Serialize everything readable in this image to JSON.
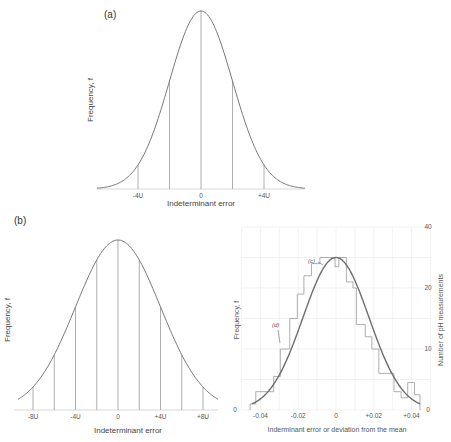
{
  "chart_data": [
    {
      "id": "a",
      "type": "line",
      "panel_label": "(a)",
      "title": "",
      "xlabel": "Indeterminant error",
      "ylabel": "Frequency, f",
      "x_tick_labels": [
        "-4U",
        "0",
        "+4U"
      ],
      "x_tick_positions_sigma": [
        -2,
        0,
        2
      ],
      "vertical_lines_sigma": [
        -2,
        -1,
        0,
        1,
        2
      ],
      "curve": "normal distribution (Gaussian), unit sigma = 2U",
      "x_range_sigma": [
        -3.3,
        3.3
      ],
      "grid": false
    },
    {
      "id": "b-left",
      "type": "line",
      "panel_label": "(b)",
      "title": "",
      "xlabel": "Indeterminant error",
      "ylabel": "Frequency, f",
      "x_tick_labels": [
        "-8U",
        "-4U",
        "0",
        "+4U",
        "+8U"
      ],
      "x_tick_positions_sigma": [
        -2,
        -1,
        0,
        1,
        2
      ],
      "vertical_lines_sigma": [
        -2,
        -1.5,
        -1,
        -0.5,
        0,
        0.5,
        1,
        1.5,
        2
      ],
      "curve": "normal distribution (Gaussian), wider, sigma = 4U",
      "x_range_sigma": [
        -2.35,
        2.35
      ],
      "grid": false
    },
    {
      "id": "b-right",
      "type": "bar",
      "subtype": "histogram with fitted normal curve",
      "title": "",
      "xlabel": "Inderminant error or deviation from the mean",
      "ylabel_left": "Frequency, f",
      "ylabel_right": "Number of pH measurements",
      "x_tick_labels": [
        "-0.04",
        "-0.02",
        "0",
        "+0.02",
        "+0.04"
      ],
      "x_ticks": [
        -0.04,
        -0.02,
        0,
        0.02,
        0.04
      ],
      "y_left_tick_labels": [
        "0"
      ],
      "y_right_tick_labels": [
        "0",
        "10",
        "20",
        "40"
      ],
      "y_right_ticks": [
        0,
        10,
        20,
        30
      ],
      "xlim": [
        -0.047,
        0.047
      ],
      "ylim": [
        0,
        30
      ],
      "grid": true,
      "annotations": [
        {
          "text": "(c)",
          "target": "fitted curve near x=-0.007"
        },
        {
          "text": "(d)",
          "target": "histogram step near x=-0.029"
        }
      ],
      "histogram": {
        "bin_edges": [
          -0.0455,
          -0.0425,
          -0.037,
          -0.033,
          -0.0295,
          -0.0245,
          -0.0205,
          -0.017,
          -0.013,
          -0.0085,
          -0.0035,
          -0.0005,
          0.0015,
          0.0055,
          0.009,
          0.0108,
          0.0155,
          0.019,
          0.0227,
          0.0265,
          0.0307,
          0.0345,
          0.038,
          0.0397,
          0.0416,
          0.0445
        ],
        "counts": [
          1,
          3,
          3,
          5.5,
          10,
          15,
          19,
          22,
          24,
          25,
          25,
          23.5,
          25,
          21,
          20,
          14,
          12,
          10,
          6,
          6,
          3,
          2,
          4.5,
          4.5,
          2.5
        ]
      },
      "fit_curve": {
        "mean": 0,
        "peak_count": 25,
        "sigma": 0.0175
      }
    }
  ]
}
